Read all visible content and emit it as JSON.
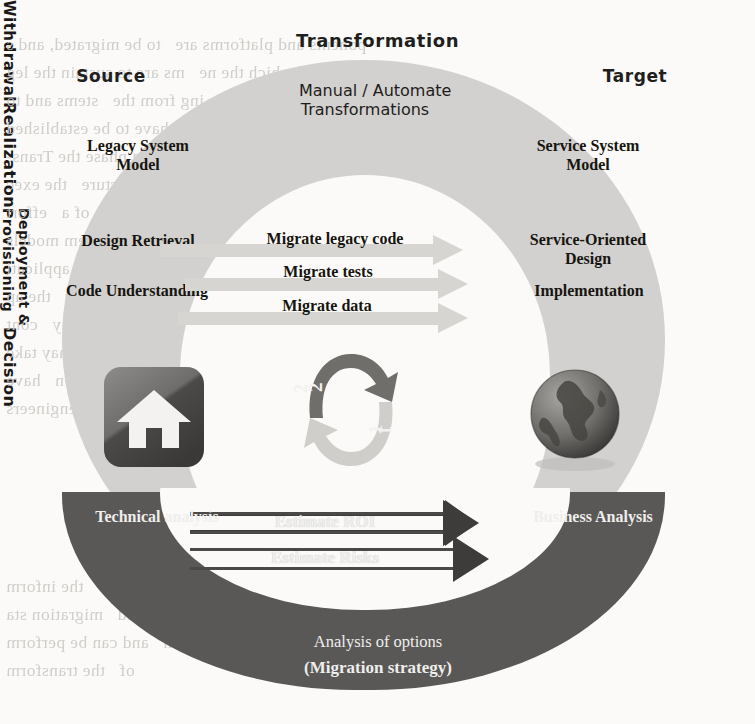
{
  "figure": {
    "type": "cycle-diagram",
    "title": "Transformation",
    "phases": {
      "top_center": "Transformation",
      "left": "Source",
      "right": "Target",
      "center_top": "Manual / Automate\nTransformations"
    },
    "vertical_labels": {
      "left": "Withdrawal",
      "right_upper": "Realization",
      "right_middle": "Deployment &\nProvisioning",
      "right_lower": "Decision"
    },
    "source_column": [
      "Legacy System\nModel",
      "Design Retrieval",
      "Code Understanding"
    ],
    "target_column": [
      "Service System\nModel",
      "Service-Oriented\nDesign",
      "Implementation"
    ],
    "transform_arrows": [
      "Migrate legacy code",
      "Migrate tests",
      "Migrate data"
    ],
    "decision_band": {
      "left_label": "Technical analysis",
      "right_label": "Business Analysis",
      "arrows": [
        "Estimate ROI",
        "Estimate Risks"
      ],
      "bottom_line_1": "Analysis of options",
      "bottom_line_2": "(Migration strategy)"
    },
    "cycle_badge": {
      "step_outer": "2",
      "step_inner": "1"
    },
    "icons": {
      "left": "house-icon",
      "right": "globe-icon",
      "center": "circular-arrows-icon"
    },
    "colors": {
      "ring_light": "#d2d1cf",
      "ring_dark": "#595856",
      "arrow_light": "#d6d5d2",
      "arrow_dark": "#3d3c3a",
      "page": "#fbfaf8",
      "text": "#17150f"
    }
  },
  "background_bleed": {
    "line1": "ponents and platforms are   to be migrated, and s",
    "line2": "ines, at end of which the ne   ms are to sustain the leg",
    "line3": "s to perform the reverse     ing from the   stems and to",
    "line4": "lative and Service Level Agreements (SLAs) have to be established",
    "line5": "ustainment and provisioning phase the Trans-",
    "line6": "with   incremental structure   the exec",
    "line7": "tion. The migration   also integration of a   effort",
    "line8": "to core competencies. The   stem models",
    "line9": "alities that are effectin   required by   applicati",
    "line10": "states. Since there are   variants for   the ap",
    "line11": "ation and   how to do the   ents may   cont",
    "line12": "ns for the   transformation   may take",
    "line13": "a   the hotspots of   happen   have",
    "line14": "nd   assisted for   engineers",
    "line15": "So    a useful tool to   the inform",
    "line16": "nd    nts and   phased   migration sta",
    "line17": "nd of using various migration   and can be perform",
    "line18": "of   the transform"
  }
}
